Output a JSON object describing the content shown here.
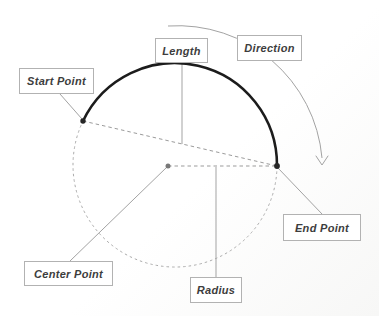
{
  "diagram": {
    "labels": {
      "length": "Length",
      "direction": "Direction",
      "start_point": "Start Point",
      "end_point": "End Point",
      "center_point": "Center Point",
      "radius": "Radius"
    },
    "colors": {
      "arc_stroke": "#1c1c1c",
      "dashed_circle_stroke": "#ababab",
      "dashed_line_stroke": "#9b9b9b",
      "leader_stroke": "#a3a3a3",
      "endpoint_fill": "#262626",
      "center_point_fill": "#787878",
      "label_border": "#b2b2b2",
      "label_text": "#3d3d3d"
    }
  }
}
